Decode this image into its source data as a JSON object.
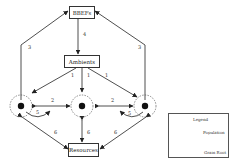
{
  "diagram": {
    "nodes": {
      "bbefs": "BBEFs",
      "ambients": "Ambients",
      "resources": "Resources"
    },
    "edge_labels": {
      "bbefs_ambients": "4",
      "left_bbefs": "3",
      "right_bbefs": "3",
      "amb_left": "1",
      "amb_mid": "1",
      "amb_right": "1",
      "left_mid": "2",
      "mid_right": "2",
      "left_self": "5",
      "right_self": "5",
      "left_res": "6",
      "mid_res": "6",
      "right_res": "6"
    },
    "legend": {
      "title": "Legend",
      "population": "Population",
      "grain_root": "Grain Root"
    }
  }
}
